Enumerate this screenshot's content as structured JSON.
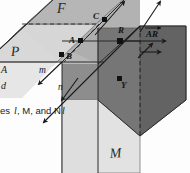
{
  "figure": {
    "background_color": "#fdfdfd",
    "planes": [
      {
        "id": "plane-p",
        "label": "P",
        "label_style": "script",
        "fill": "#d8d8d8",
        "stroke": "#6e6e6e"
      },
      {
        "id": "plane-f",
        "label": "F",
        "label_style": "script",
        "fill": "#b9b9b9",
        "stroke": "#6e6e6e"
      },
      {
        "id": "plane-m",
        "label": "M",
        "label_style": "script",
        "fill": "#e2e2e2",
        "stroke": "#6e6e6e"
      }
    ],
    "shaded_regions": [
      {
        "id": "region-mid-gray",
        "fill": "#a8a8a8"
      },
      {
        "id": "region-dark-right",
        "fill": "#646464"
      },
      {
        "id": "region-dark-lower",
        "fill": "#7a7a7a"
      },
      {
        "id": "region-light-lower",
        "fill": "#cfcfcf"
      }
    ],
    "points": [
      {
        "name": "A",
        "label": "A",
        "x": 72,
        "y": 41
      },
      {
        "name": "B",
        "label": "B",
        "x": 63,
        "y": 55
      },
      {
        "name": "C",
        "label": "C",
        "x": 104,
        "y": 19
      },
      {
        "name": "R",
        "label": "R",
        "x": 121,
        "y": 41
      },
      {
        "name": "Y",
        "label": "Y",
        "x": 119,
        "y": 79
      }
    ],
    "lines": [
      {
        "name": "m",
        "label": "m"
      },
      {
        "name": "n",
        "label": "n"
      }
    ],
    "vectors": [
      {
        "name": "AR",
        "label": "AR",
        "notation": "ray-arrow-overbar"
      }
    ],
    "caption_fragments": [
      {
        "id": "frag-a",
        "text": "A"
      },
      {
        "id": "frag-b",
        "text": "d"
      },
      {
        "id": "frag-c",
        "text": "es"
      },
      {
        "id": "frag-c-italic",
        "text": "l"
      },
      {
        "id": "frag-d",
        "text": ", M, and N"
      },
      {
        "id": "frag-e",
        "text": "l"
      }
    ]
  }
}
